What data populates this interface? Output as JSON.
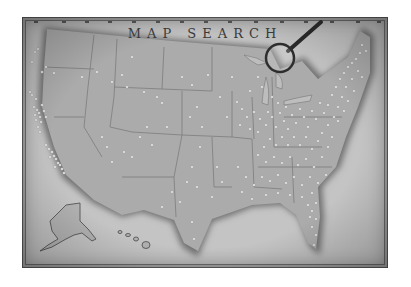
{
  "map": {
    "title": "MAP SEARCH",
    "style": "vintage grayscale illustrated map of the United States",
    "colors": {
      "paper": "#c4c4c4",
      "land": "#a9a9a9",
      "coast_shadow": "#6a6a6a",
      "state_lines": "#7a7a7a",
      "location_dots": "#f2f2f2",
      "frame": "#555555"
    },
    "icons": {
      "magnifier": "magnifying-glass-icon"
    },
    "insets": [
      "Alaska",
      "Hawaii"
    ],
    "markers_density": "sparse in west, very dense in east"
  }
}
